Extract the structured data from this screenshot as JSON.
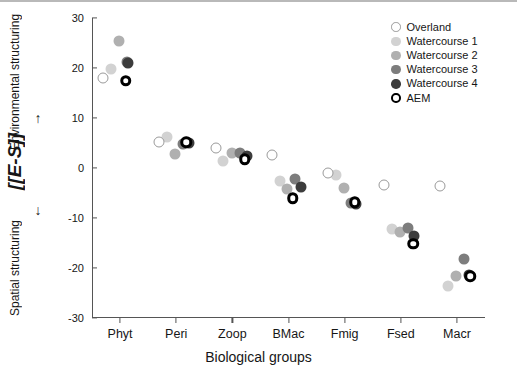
{
  "chart_data": {
    "type": "scatter",
    "title": "",
    "xlabel": "Biological groups",
    "ylabel": "[E-S]",
    "ylabel_top": "Environmental structuring",
    "ylabel_bottom": "Spatial structuring",
    "ylabel_arrow_up": "↑",
    "ylabel_arrow_down": "↓",
    "ylim": [
      -30,
      30
    ],
    "yticks": [
      30,
      20,
      10,
      0,
      -10,
      -20,
      -30
    ],
    "ytick_labels": [
      "30",
      "20",
      "10",
      "0",
      "-10",
      "-20",
      "-30"
    ],
    "grid": false,
    "legend_position": "top-right",
    "categories": [
      "Phyt",
      "Peri",
      "Zoop",
      "BMac",
      "Fmig",
      "Fsed",
      "Macr"
    ],
    "series": [
      {
        "name": "Overland",
        "key": "overland",
        "color": "#ffffff",
        "edge_color": "#9a9a9a",
        "style": "open-circle",
        "values": [
          18.0,
          5.3,
          4.1,
          2.7,
          -1.0,
          -3.3,
          -3.5
        ],
        "x_offsets": [
          -0.3,
          -0.3,
          -0.3,
          -0.3,
          -0.3,
          -0.3,
          -0.3
        ]
      },
      {
        "name": "Watercourse 1",
        "key": "wc1",
        "color": "#d2d2d2",
        "style": "filled-circle",
        "values": [
          19.9,
          6.2,
          1.5,
          -2.5,
          -1.4,
          -12.1,
          -23.6
        ],
        "x_offsets": [
          -0.16,
          -0.16,
          -0.16,
          -0.16,
          -0.16,
          -0.16,
          -0.16
        ]
      },
      {
        "name": "Watercourse 2",
        "key": "wc2",
        "color": "#b0b0b0",
        "style": "filled-circle",
        "values": [
          25.4,
          2.8,
          3.1,
          -4.1,
          -4.0,
          -12.8,
          -21.6
        ],
        "x_offsets": [
          -0.02,
          -0.02,
          0.0,
          -0.02,
          -0.02,
          -0.02,
          -0.02
        ]
      },
      {
        "name": "Watercourse 3",
        "key": "wc3",
        "color": "#7d7d7d",
        "style": "filled-circle",
        "values": [
          21.3,
          4.9,
          3.0,
          -2.2,
          -6.9,
          -11.9,
          -18.2
        ],
        "x_offsets": [
          0.12,
          0.12,
          0.14,
          0.12,
          0.12,
          0.12,
          0.12
        ]
      },
      {
        "name": "Watercourse 4",
        "key": "wc4",
        "color": "#3c3c3c",
        "style": "filled-circle",
        "values": [
          21.1,
          5.1,
          2.4,
          -3.8,
          -7.1,
          -13.6,
          -21.4
        ],
        "x_offsets": [
          0.14,
          0.22,
          0.26,
          0.22,
          0.2,
          0.24,
          0.22
        ]
      },
      {
        "name": "AEM",
        "key": "aem",
        "color": "#ffffff",
        "edge_color": "#000000",
        "style": "ring-circle",
        "values": [
          17.5,
          5.2,
          1.8,
          -6.0,
          -6.8,
          -15.1,
          -21.6
        ],
        "x_offsets": [
          0.1,
          0.18,
          0.22,
          0.08,
          0.18,
          0.22,
          0.24
        ]
      }
    ]
  },
  "legend": {
    "entries": [
      {
        "label": "Overland",
        "key": "overland"
      },
      {
        "label": "Watercourse 1",
        "key": "wc1"
      },
      {
        "label": "Watercourse 2",
        "key": "wc2"
      },
      {
        "label": "Watercourse 3",
        "key": "wc3"
      },
      {
        "label": "Watercourse 4",
        "key": "wc4"
      },
      {
        "label": "AEM",
        "key": "aem"
      }
    ]
  },
  "colors": {
    "overland": "#ffffff",
    "overland_edge": "#9a9a9a",
    "watercourse1": "#d2d2d2",
    "watercourse2": "#b0b0b0",
    "watercourse3": "#7d7d7d",
    "watercourse4": "#3c3c3c",
    "aem_edge": "#000000",
    "axis": "#555555",
    "text": "#161616"
  }
}
